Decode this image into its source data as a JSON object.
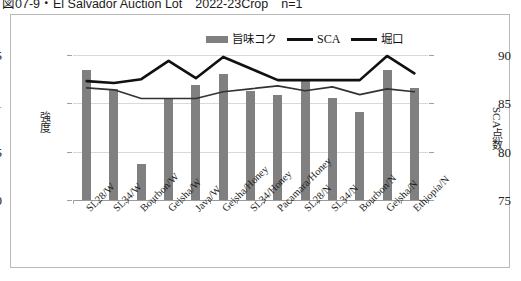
{
  "caption": "図07-9・El Salvador Auction Lot　2022-23Crop　n=1",
  "legend": {
    "items": [
      {
        "label": "旨味コク",
        "kind": "bar",
        "color": "#808080"
      },
      {
        "label": "SCA",
        "kind": "line",
        "color": "#111111"
      },
      {
        "label": "堀口",
        "kind": "line",
        "color": "#111111"
      }
    ]
  },
  "axes": {
    "left_title": "強度",
    "right_title": "SCA点数",
    "left_ticks": [
      "1.5",
      "1",
      "0.5",
      "0"
    ],
    "right_ticks": [
      "90",
      "85",
      "80",
      "75"
    ]
  },
  "chart_data": {
    "type": "bar",
    "title": "図07-9・El Salvador Auction Lot　2022-23Crop　n=1",
    "xlabel": "",
    "ylabel": "強度",
    "y2label": "SCA点数",
    "ylim": [
      0,
      1.5
    ],
    "y2lim": [
      75,
      90
    ],
    "grid": true,
    "legend_position": "top-center",
    "categories": [
      "SL28/W",
      "SL34/W",
      "Bourbon/W",
      "Geisha/W",
      "Java/W",
      "Geisha/Honey",
      "SL34/Honey",
      "Pacamara/Honey",
      "SL28/N",
      "SL34/N",
      "Bourbon/N",
      "Geisha/N",
      "Ethiopia/N"
    ],
    "series": [
      {
        "name": "旨味コク",
        "type": "bar",
        "axis": "left",
        "color": "#808080",
        "values": [
          1.35,
          1.15,
          0.37,
          1.06,
          1.19,
          1.3,
          1.13,
          1.09,
          1.23,
          1.06,
          0.91,
          1.35,
          1.16
        ]
      },
      {
        "name": "SCA",
        "type": "line",
        "axis": "right",
        "color": "#111111",
        "values": [
          87.3,
          87.1,
          87.5,
          89.4,
          87.6,
          89.8,
          88.6,
          87.4,
          87.4,
          87.4,
          87.4,
          89.9,
          88.1
        ]
      },
      {
        "name": "堀口",
        "type": "line",
        "axis": "right",
        "color": "#333333",
        "values": [
          86.6,
          86.4,
          85.5,
          85.5,
          85.5,
          86.2,
          86.5,
          86.8,
          86.3,
          86.7,
          85.9,
          86.5,
          86.2
        ]
      }
    ]
  }
}
